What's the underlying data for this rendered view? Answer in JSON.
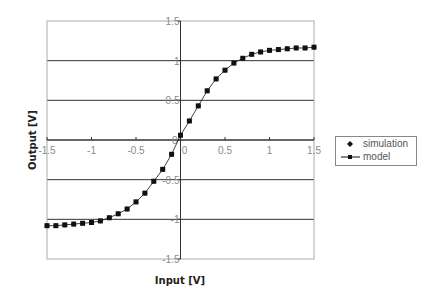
{
  "chart_data": {
    "type": "scatter",
    "title": "",
    "xlabel": "Input [V]",
    "ylabel": "Output [V]",
    "xlim": [
      -1.5,
      1.5
    ],
    "ylim": [
      -1.5,
      1.5
    ],
    "xticks": [
      -1.5,
      -1,
      -0.5,
      0,
      0.5,
      1,
      1.5
    ],
    "yticks": [
      -1.5,
      -1,
      -0.5,
      0,
      0.5,
      1,
      1.5
    ],
    "xtick_labels": [
      "-1.5",
      "-1",
      "-0.5",
      "0",
      "0.5",
      "1",
      "1.5"
    ],
    "ytick_labels": [
      "-1.5",
      "-1",
      "-0.5",
      "0",
      "0.5",
      "1",
      "1.5"
    ],
    "grid": "horizontal major gridlines",
    "legend_position": "right",
    "x": [
      -1.5,
      -1.4,
      -1.3,
      -1.2,
      -1.1,
      -1.0,
      -0.9,
      -0.8,
      -0.7,
      -0.6,
      -0.5,
      -0.4,
      -0.3,
      -0.2,
      -0.1,
      0.0,
      0.1,
      0.2,
      0.3,
      0.4,
      0.5,
      0.6,
      0.7,
      0.8,
      0.9,
      1.0,
      1.1,
      1.2,
      1.3,
      1.4,
      1.5
    ],
    "series": [
      {
        "name": "simulation",
        "marker": "diamond",
        "line": false,
        "values": [
          -1.08,
          -1.08,
          -1.07,
          -1.06,
          -1.05,
          -1.04,
          -1.02,
          -0.98,
          -0.93,
          -0.87,
          -0.78,
          -0.67,
          -0.52,
          -0.37,
          -0.18,
          0.06,
          0.24,
          0.43,
          0.62,
          0.77,
          0.88,
          0.97,
          1.03,
          1.08,
          1.11,
          1.13,
          1.14,
          1.15,
          1.16,
          1.16,
          1.17
        ]
      },
      {
        "name": "model",
        "marker": "square",
        "line": true,
        "values": [
          -1.08,
          -1.08,
          -1.07,
          -1.06,
          -1.05,
          -1.04,
          -1.02,
          -0.98,
          -0.93,
          -0.87,
          -0.78,
          -0.67,
          -0.52,
          -0.37,
          -0.18,
          0.06,
          0.24,
          0.43,
          0.62,
          0.77,
          0.88,
          0.97,
          1.03,
          1.08,
          1.11,
          1.13,
          1.14,
          1.15,
          1.16,
          1.16,
          1.17
        ]
      }
    ]
  },
  "legend": {
    "items": [
      {
        "label": "simulation",
        "symbol": "diamond"
      },
      {
        "label": "model",
        "symbol": "line-square"
      }
    ]
  },
  "colors": {
    "series": "#111111",
    "gridline": "#333333",
    "plot_border": "#aaaaaa",
    "tick_label": "#8a8a8a"
  }
}
